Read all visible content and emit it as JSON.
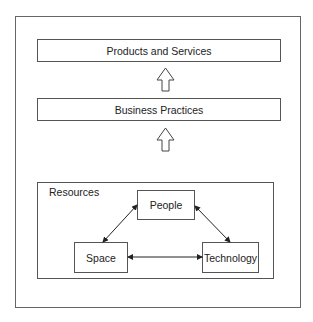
{
  "diagram": {
    "top_box": "Products and Services",
    "middle_box": "Business Practices",
    "resources_group": {
      "label": "Resources",
      "nodes": [
        "People",
        "Space",
        "Technology"
      ],
      "connections": [
        {
          "from": "People",
          "to": "Space",
          "type": "bidirectional"
        },
        {
          "from": "People",
          "to": "Technology",
          "type": "bidirectional"
        },
        {
          "from": "Space",
          "to": "Technology",
          "type": "bidirectional"
        }
      ]
    },
    "flow": [
      {
        "from": "Resources",
        "to": "Business Practices",
        "type": "hollow-arrow-up"
      },
      {
        "from": "Business Practices",
        "to": "Products and Services",
        "type": "hollow-arrow-up"
      }
    ]
  }
}
